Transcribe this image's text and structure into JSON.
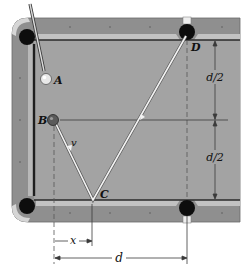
{
  "figure": {
    "type": "billiard-table-geometry",
    "colors": {
      "felt": "#a3a3a3",
      "rail": "#8f8f8f",
      "rail_edge": "#c9c9c9",
      "cushion": "#2a2a2a",
      "pocket": "#0d0d0d",
      "path": "#f2f2f2",
      "dim_line": "#3a3a3a",
      "ball_a": "#e8e8e8",
      "ball_b": "#5a5a5a"
    },
    "balls": [
      {
        "id": "A",
        "label": "A"
      },
      {
        "id": "B",
        "label": "B"
      }
    ],
    "points": {
      "C": "C",
      "D": "D"
    },
    "velocity_label": "v",
    "dimensions": {
      "half_upper": "d/2",
      "half_lower": "d/2",
      "x": "x",
      "d": "d"
    }
  }
}
